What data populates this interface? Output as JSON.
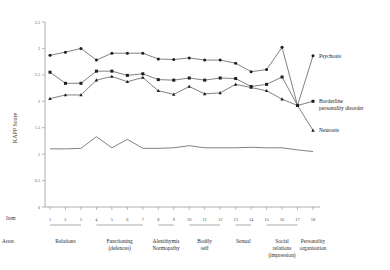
{
  "chart_data": {
    "type": "line",
    "title": "",
    "subtitle": "",
    "xlabel": "Item",
    "ylabel": "KAPP Score",
    "ylim": [
      0,
      3.5
    ],
    "yticks": [
      0,
      0.5,
      1,
      1.5,
      2,
      2.5,
      3,
      3.5
    ],
    "ytick_labels": [
      "0",
      "0.5",
      "1",
      "1.5",
      "2",
      "2.5",
      "3",
      "3.5"
    ],
    "x": [
      1,
      2,
      3,
      4,
      5,
      6,
      7,
      8,
      9,
      10,
      11,
      12,
      13,
      14,
      15,
      16,
      17,
      18
    ],
    "xtick_labels": [
      "1",
      "2",
      "3",
      "4",
      "5",
      "6",
      "7",
      "8",
      "9",
      "10",
      "11",
      "12",
      "13",
      "14",
      "15",
      "16",
      "17",
      "18"
    ],
    "grid": false,
    "legend_position": "right-inline",
    "series": [
      {
        "name": "Psychosis",
        "marker": "circle",
        "values": [
          2.87,
          2.93,
          3.0,
          2.78,
          2.91,
          2.91,
          2.91,
          2.8,
          2.79,
          2.82,
          2.78,
          2.78,
          2.72,
          2.56,
          2.6,
          3.02,
          1.92,
          2.86
        ]
      },
      {
        "name": "Borderline personality disorder",
        "marker": "square",
        "values": [
          2.55,
          2.34,
          2.34,
          2.57,
          2.57,
          2.49,
          2.52,
          2.41,
          2.4,
          2.44,
          2.4,
          2.44,
          2.43,
          2.28,
          2.32,
          2.46,
          1.92,
          2.0
        ]
      },
      {
        "name": "Neurosis",
        "marker": "triangle",
        "values": [
          2.05,
          2.12,
          2.12,
          2.4,
          2.47,
          2.37,
          2.45,
          2.2,
          2.13,
          2.28,
          2.14,
          2.16,
          2.32,
          2.26,
          2.2,
          2.04,
          1.92,
          1.45
        ]
      },
      {
        "name": "Neurosis-baseline",
        "marker": "none",
        "values": [
          1.1,
          1.1,
          1.11,
          1.33,
          1.12,
          1.28,
          1.11,
          1.11,
          1.12,
          1.16,
          1.12,
          1.12,
          1.12,
          1.13,
          1.12,
          1.12,
          1.08,
          1.05
        ]
      }
    ],
    "row_headers": {
      "item": "Item",
      "areas": "Areas"
    },
    "area_groups": [
      {
        "label": "Relations",
        "from": 1,
        "to": 3
      },
      {
        "label": "Functioning\n(defences)",
        "from": 4,
        "to": 7
      },
      {
        "label": "Alexithymia\nNormopathy",
        "from": 8,
        "to": 9
      },
      {
        "label": "Bodily\nself",
        "from": 10,
        "to": 12
      },
      {
        "label": "Sexual",
        "from": 13,
        "to": 14
      },
      {
        "label": "Social\nrelations\n(impression)",
        "from": 15,
        "to": 17
      },
      {
        "label": "Personality\norganisation",
        "from": 18,
        "to": 18
      }
    ],
    "annotations": [
      {
        "text": "Psychosis",
        "x": 18,
        "y": 2.86
      },
      {
        "text": "Borderline",
        "x": 18,
        "y": 2.0
      },
      {
        "text": "personality disorder",
        "x": 18,
        "y": 1.88
      },
      {
        "text": "Neurosis",
        "x": 18,
        "y": 1.45
      }
    ],
    "colors": {
      "line": "#4a4a4a",
      "marker": "#1d1d1d",
      "axis": "#9a9a9a",
      "text": "#2b2b2b",
      "background": "#ffffff"
    }
  }
}
